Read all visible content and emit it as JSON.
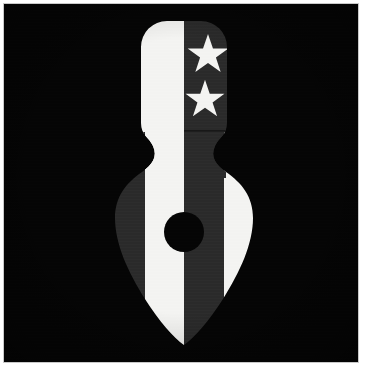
{
  "image": {
    "title": "Two-star spade emblem",
    "subject": "heraldic arrowhead / spade emblem split vertically into light and dark halves",
    "width": 365,
    "height": 373,
    "background_color": "#ffffff",
    "photo": {
      "frame_color": "#c9c9c9",
      "field_color": "#050505",
      "x": 4,
      "y": 4,
      "width": 354,
      "height": 358
    }
  },
  "palette": {
    "black_field": "#050505",
    "white": "#f4f4f2",
    "dark_gray": "#2b2b2b",
    "mid_gray": "#333333",
    "pupil_black": "#050505",
    "frame_gray": "#c9c9c9"
  },
  "emblem": {
    "name": "spade-emblem",
    "axis_x": 180,
    "top_y": 17,
    "tip_y": 341,
    "parts": [
      {
        "name": "handle",
        "description": "rounded-top rectangular handle, top of the emblem",
        "left_x": 137,
        "right_x": 224,
        "top_y": 17,
        "bottom_y": 124,
        "corner_radius": 26,
        "left_half_color": "#f4f4f2",
        "right_half_color": "#2b2b2b"
      },
      {
        "name": "waist",
        "description": "s-curve neck joining handle to bulb",
        "top_y": 124,
        "bottom_y": 170,
        "narrowest_width": 60
      },
      {
        "name": "bulb",
        "description": "wide rounded body tapering to a point",
        "left_x": 109,
        "right_x": 250,
        "widest_y": 200,
        "tip_y": 341
      },
      {
        "name": "center-dot",
        "description": "black circular hole at centre of bulb",
        "center_x": 180,
        "center_y": 228,
        "radius": 20,
        "color": "#050505"
      }
    ],
    "bands": [
      {
        "name": "outer-left-band",
        "color": "#2b2b2b",
        "side": "left"
      },
      {
        "name": "inner-left-band",
        "color": "#f4f4f2",
        "side": "left"
      },
      {
        "name": "inner-right-band",
        "color": "#2b2b2b",
        "side": "right"
      },
      {
        "name": "outer-right-band",
        "color": "#f4f4f2",
        "side": "right"
      }
    ]
  },
  "stars": {
    "count": 2,
    "color": "#f4f4f2",
    "placement": "dark right half of handle",
    "items": [
      {
        "name": "star-upper",
        "center_x": 204,
        "center_y": 51,
        "outer_radius": 22,
        "rotation_deg": 0
      },
      {
        "name": "star-lower",
        "center_x": 201,
        "center_y": 96,
        "outer_radius": 21,
        "rotation_deg": 0
      }
    ]
  }
}
